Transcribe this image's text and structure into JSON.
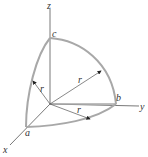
{
  "diagram": {
    "axes": {
      "x": "x",
      "y": "y",
      "z": "z"
    },
    "points": {
      "a": "a",
      "b": "b",
      "c": "c"
    },
    "radius_labels": [
      "r",
      "r",
      "r"
    ],
    "colors": {
      "arc": "#a8a8a8",
      "axis": "#555555",
      "text": "#333333"
    }
  }
}
